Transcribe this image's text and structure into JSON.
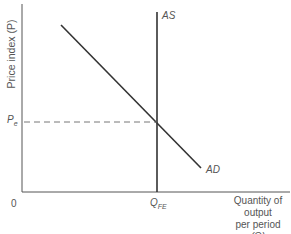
{
  "diagram": {
    "y_axis_label": "Price index (P)",
    "x_axis_label_line1": "Quantity of output",
    "x_axis_label_line2": "per period",
    "x_axis_label_line3": "(Q)",
    "origin_label": "0",
    "price_level_label": "P",
    "price_level_subscript": "e",
    "quantity_label": "Q",
    "quantity_subscript": "FE",
    "as_curve_label": "AS",
    "ad_curve_label": "AD",
    "line_color": "#333333",
    "dash_color": "#666666"
  }
}
